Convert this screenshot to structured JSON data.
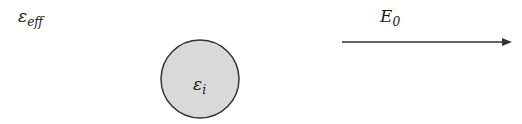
{
  "diagram": {
    "medium_label": {
      "symbol": "ε",
      "subscript": "eff"
    },
    "inclusion": {
      "label": {
        "symbol": "ε",
        "subscript": "i"
      },
      "shape": "circle",
      "center": [
        200,
        79
      ],
      "radius": 39,
      "fill": "#d9d9d9",
      "stroke": "#333333"
    },
    "field": {
      "label": {
        "symbol": "E",
        "subscript": "0"
      },
      "arrow": {
        "x1": 342,
        "x2": 512,
        "y": 42,
        "color": "#333333"
      }
    }
  }
}
